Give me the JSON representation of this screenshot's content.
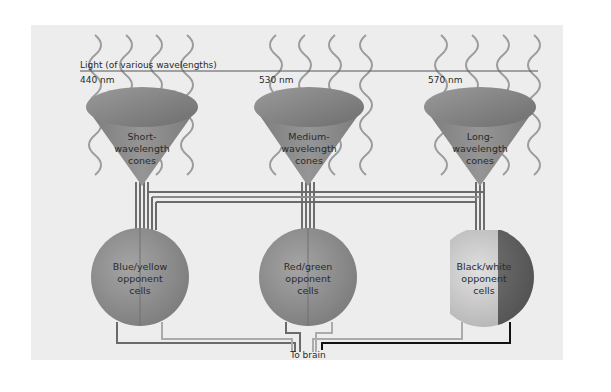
{
  "diagram": {
    "light_label": "Light (of various wavelengths)",
    "cones": [
      {
        "wavelength": "440 nm",
        "line1": "Short-",
        "line2": "wavelength",
        "line3": "cones"
      },
      {
        "wavelength": "530 nm",
        "line1": "Medium-",
        "line2": "wavelength",
        "line3": "cones"
      },
      {
        "wavelength": "570 nm",
        "line1": "Long-",
        "line2": "wavelength",
        "line3": "cones"
      }
    ],
    "opponent_cells": [
      {
        "line1": "Blue/yellow",
        "line2": "opponent",
        "line3": "cells"
      },
      {
        "line1": "Red/green",
        "line2": "opponent",
        "line3": "cells"
      },
      {
        "line1": "Black/white",
        "line2": "opponent",
        "line3": "cells"
      }
    ],
    "output_label": "To brain",
    "colors": {
      "panel_bg": "#ededed",
      "cone": "#8a8a8a",
      "cell": "#8e8e8e",
      "wire_dark": "#6a6a6a",
      "wire_light": "#ababab",
      "wire_black": "#111111",
      "wave": "#9a9a9a"
    }
  }
}
